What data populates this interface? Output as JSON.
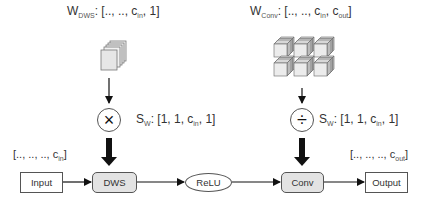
{
  "weights": {
    "dws": {
      "symbol": "W",
      "subscript": "DWS",
      "shape_prefix": ": [.., .., c",
      "shape_sub": "in",
      "shape_suffix": ", 1]"
    },
    "conv": {
      "symbol": "W",
      "subscript": "Conv",
      "shape_prefix": ": [.., .., c",
      "shape_sub": "in",
      "shape_mid": ", c",
      "shape_sub2": "out",
      "shape_suffix": "]"
    }
  },
  "operators": {
    "multiply": {
      "glyph": "×",
      "label_symbol": "S",
      "label_sub": "W",
      "label_prefix": ": [1, 1, c",
      "label_sub2": "in",
      "label_suffix": ", 1]"
    },
    "divide": {
      "glyph": "÷",
      "label_symbol": "S",
      "label_sub": "W",
      "label_prefix": ": [1, 1, c",
      "label_sub2": "in",
      "label_suffix": ", 1]"
    }
  },
  "pipeline": {
    "input": "Input",
    "dws": "DWS",
    "relu": "ReLU",
    "conv": "Conv",
    "output": "Output"
  },
  "shapes": {
    "input_prefix": "[.., .., .., c",
    "input_sub": "in",
    "input_suffix": "]",
    "output_prefix": "[.., .., .., c",
    "output_sub": "out",
    "output_suffix": "]"
  }
}
